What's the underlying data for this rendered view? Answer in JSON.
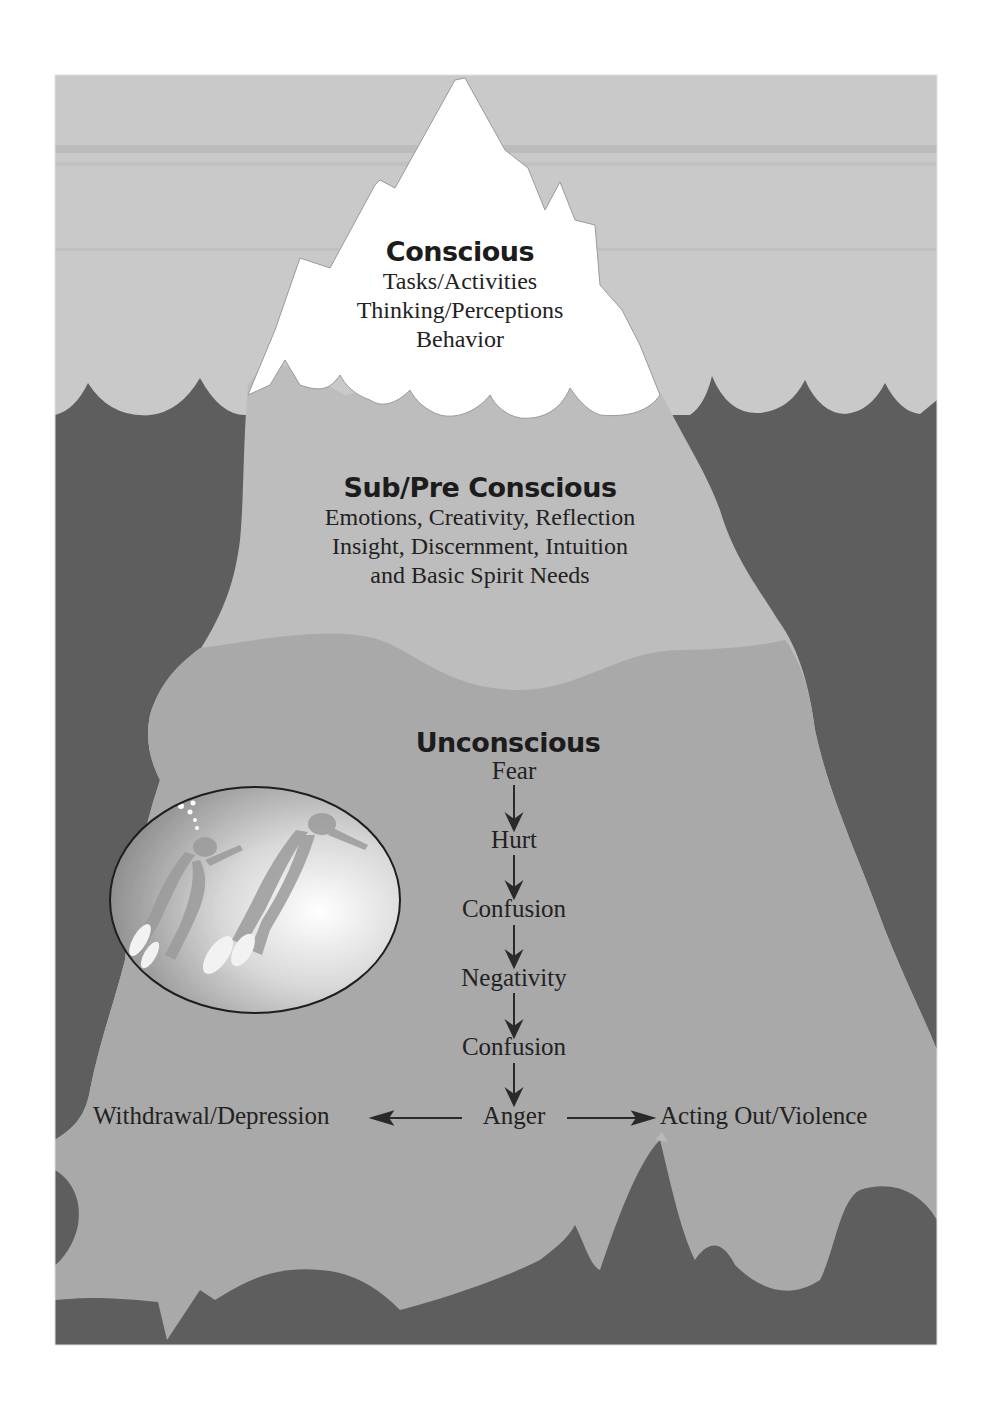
{
  "diagram": {
    "colors": {
      "sky": "#c9c9c9",
      "ocean": "#5e5e5e",
      "ice_tip": "#ffffff",
      "ice_subconscious": "#bdbdbd",
      "ice_unconscious": "#a9a9a9",
      "text": "#222222"
    },
    "levels": {
      "conscious": {
        "heading": "Conscious",
        "lines": [
          "Tasks/Activities",
          "Thinking/Perceptions",
          "Behavior"
        ]
      },
      "subconscious": {
        "heading": "Sub/Pre Conscious",
        "lines": [
          "Emotions, Creativity, Reflection",
          "Insight, Discernment, Intuition",
          "and Basic Spirit Needs"
        ]
      },
      "unconscious": {
        "heading": "Unconscious",
        "chain": [
          "Fear",
          "Hurt",
          "Confusion",
          "Negativity",
          "Confusion",
          "Anger"
        ],
        "branch_left": "Withdrawal/Depression",
        "branch_right": "Acting Out/Violence"
      }
    },
    "inset_image": {
      "subject": "two scuba divers swimming underwater"
    }
  }
}
